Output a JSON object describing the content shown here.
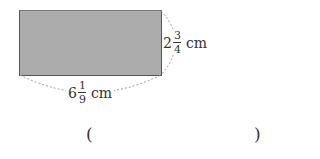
{
  "figure": {
    "shape": "rectangle",
    "fill_color": "#acacac",
    "border_color": "#555555",
    "height_label": {
      "whole": "2",
      "numerator": "3",
      "denominator": "4",
      "unit": "cm"
    },
    "width_label": {
      "whole": "6",
      "numerator": "1",
      "denominator": "9",
      "unit": "cm"
    }
  },
  "answer": {
    "open": "(",
    "close": ")",
    "value": ""
  }
}
